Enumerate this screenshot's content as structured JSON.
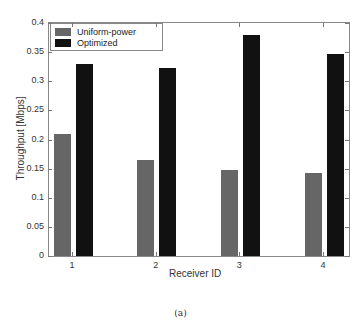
{
  "chart_data": {
    "type": "bar",
    "title": "",
    "xlabel": "Receiver ID",
    "ylabel": "Throughput [Mbps]",
    "categories": [
      "1",
      "2",
      "3",
      "4"
    ],
    "series": [
      {
        "name": "Uniform-power",
        "color": "#666666",
        "values": [
          0.21,
          0.165,
          0.148,
          0.142
        ]
      },
      {
        "name": "Optimized",
        "color": "#111111",
        "values": [
          0.33,
          0.322,
          0.38,
          0.346
        ]
      }
    ],
    "ylim": [
      0,
      0.4
    ],
    "yticks": [
      "0",
      "0.05",
      "0.1",
      "0.15",
      "0.2",
      "0.25",
      "0.3",
      "0.35",
      "0.4"
    ],
    "grid": false,
    "legend_position": "upper left"
  },
  "caption": "(a)"
}
